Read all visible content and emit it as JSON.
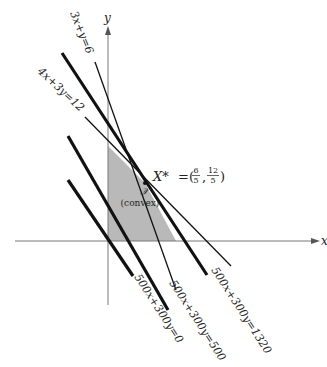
{
  "diagram": {
    "type": "linear-programming-feasible-region",
    "axes": {
      "x_label": "x",
      "y_label": "y"
    },
    "region": {
      "symbol": "𝒳",
      "label": "(convex)",
      "fill": "#b9b9b9"
    },
    "optimum": {
      "label": "X* = (6/5, 12/5)",
      "name": "X*",
      "x_num": "6",
      "x_den": "5",
      "y_num": "12",
      "y_den": "5"
    },
    "constraints": [
      {
        "label": "3x+y=6"
      },
      {
        "label": "4x+3y=12"
      }
    ],
    "objective_lines": [
      {
        "label": "500x+300y=0"
      },
      {
        "label": "500x+300y=500"
      },
      {
        "label": "500x+300y=1320"
      }
    ],
    "colors": {
      "line": "#111111",
      "axis": "#777777",
      "region": "#b9b9b9"
    }
  }
}
